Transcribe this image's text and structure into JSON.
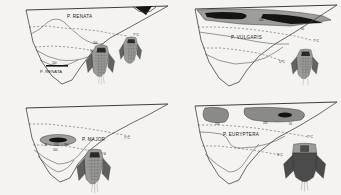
{
  "figure": {
    "background_color": "#f4f3f1",
    "line_color": "#3a3a3a",
    "shade_grey": "#9d9d9a",
    "shade_dark": "#141414"
  },
  "panels": [
    {
      "id": "panel-top-left",
      "position": "top-left",
      "species": "P. RENATA",
      "isotherms": [
        {
          "label": "7°C",
          "x": 133,
          "y": 36
        },
        {
          "label": "5°C",
          "x": 110,
          "y": 55
        }
      ],
      "abundance_numbers": [
        {
          "label": "100",
          "x": 143,
          "y": 11
        },
        {
          "label": "200",
          "x": 96,
          "y": 44
        },
        {
          "label": "50",
          "x": 92,
          "y": 52
        },
        {
          "label": "100",
          "x": 55,
          "y": 69
        }
      ],
      "shaded_zones": [
        {
          "kind": "dark-wedge",
          "location": "surface-right"
        }
      ],
      "specimens": 2
    },
    {
      "id": "panel-top-right",
      "position": "top-right",
      "species": "P. VULGARIS",
      "isotherms": [
        {
          "label": "7°C",
          "x": 146,
          "y": 45
        },
        {
          "label": "5°C",
          "x": 112,
          "y": 66
        }
      ],
      "abundance_numbers": [
        {
          "label": "100",
          "x": 45,
          "y": 18
        },
        {
          "label": "200",
          "x": 92,
          "y": 20
        },
        {
          "label": "100",
          "x": 128,
          "y": 22
        },
        {
          "label": "50",
          "x": 132,
          "y": 30
        }
      ],
      "shaded_zones": [
        {
          "kind": "grey-band",
          "location": "surface-layer"
        },
        {
          "kind": "dark-blob",
          "location": "surface-left"
        },
        {
          "kind": "dark-blob",
          "location": "surface-right"
        }
      ],
      "specimens": 1
    },
    {
      "id": "panel-bottom-left",
      "position": "bottom-left",
      "species": "P. MAJOR",
      "isotherms": [
        {
          "label": "7°C",
          "x": 131,
          "y": 37
        },
        {
          "label": "5°C",
          "x": 107,
          "y": 54
        }
      ],
      "abundance_numbers": [
        {
          "label": "50",
          "x": 49,
          "y": 48
        },
        {
          "label": "100",
          "x": 58,
          "y": 48
        },
        {
          "label": "200",
          "x": 67,
          "y": 48
        },
        {
          "label": "500",
          "x": 57,
          "y": 53
        }
      ],
      "shaded_zones": [
        {
          "kind": "dark-lens",
          "location": "mid-depth"
        }
      ],
      "specimens": 1
    },
    {
      "id": "panel-bottom-right",
      "position": "bottom-right",
      "species": "P. EURYPTERA",
      "isotherms": [
        {
          "label": "7°C",
          "x": 143,
          "y": 36
        },
        {
          "label": "5°C",
          "x": 113,
          "y": 54
        }
      ],
      "abundance_numbers": [
        {
          "label": "100",
          "x": 47,
          "y": 27
        },
        {
          "label": "200",
          "x": 95,
          "y": 26
        },
        {
          "label": "50",
          "x": 120,
          "y": 27
        }
      ],
      "shaded_zones": [
        {
          "kind": "grey-blob",
          "location": "surface-left"
        },
        {
          "kind": "grey-blob",
          "location": "surface-center"
        },
        {
          "kind": "dark-core",
          "location": "surface-center"
        }
      ],
      "specimens": 1
    }
  ]
}
